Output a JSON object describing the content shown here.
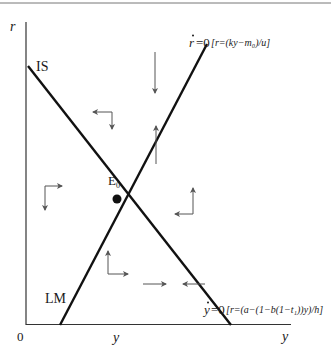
{
  "diagram": {
    "type": "phase-diagram",
    "axes": {
      "y_axis_label": "r",
      "x_axis_label": "y",
      "origin_label": "0"
    },
    "curves": {
      "is_label": "IS",
      "lm_label": "LM",
      "r_dot_prefix": "r",
      "r_dot_eq": "=0",
      "r_dot_formula": "[r=(ky−m₀)/u]",
      "y_dot_prefix": "y",
      "y_dot_eq": "=0",
      "y_dot_formula": "[r=(a−(1−b(1−t₁))y)/h]"
    },
    "equilibrium": {
      "label_main": "E",
      "label_sub": "0"
    },
    "phase_arrows": [
      {
        "region": "top",
        "direction": "left-down"
      },
      {
        "region": "right-upper",
        "direction": "down",
        "note": "above r-dot line"
      },
      {
        "region": "right-upper",
        "direction": "up",
        "note": "below r-dot line"
      },
      {
        "region": "left",
        "direction": "right-down"
      },
      {
        "region": "right",
        "direction": "left-up"
      },
      {
        "region": "bottom",
        "direction": "right-up"
      },
      {
        "region": "bottom-right",
        "direction": "right",
        "note": "left of y-dot line"
      },
      {
        "region": "bottom-right",
        "direction": "left",
        "note": "right of y-dot line"
      }
    ],
    "colors": {
      "curve": "#111111",
      "axis": "#333333",
      "arrow": "#555555",
      "background": "#ffffff"
    }
  }
}
